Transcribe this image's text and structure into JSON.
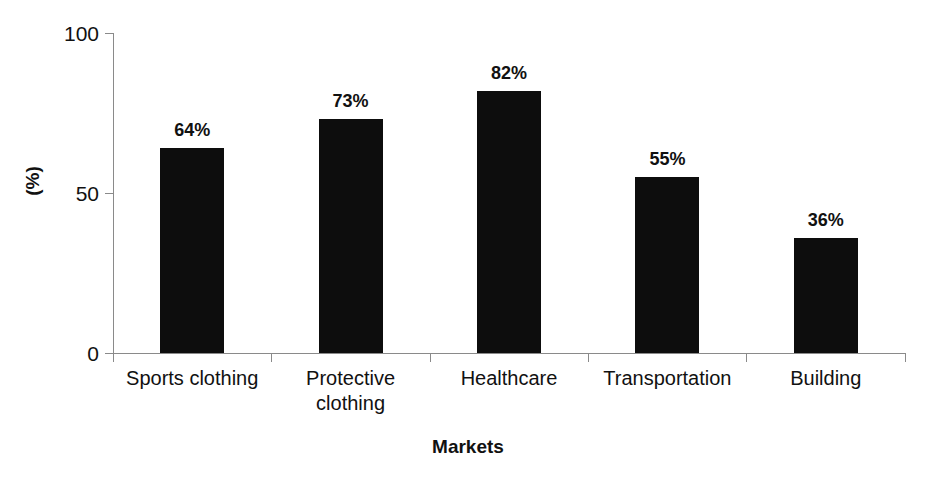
{
  "chart_data": {
    "type": "bar",
    "title": "",
    "subtitle": "",
    "xlabel": "Markets",
    "ylabel": "(%)",
    "categories": [
      "Sports clothing",
      "Protective clothing",
      "Healthcare",
      "Transportation",
      "Building"
    ],
    "category_lines": [
      [
        "Sports clothing"
      ],
      [
        "Protective",
        "clothing"
      ],
      [
        "Healthcare"
      ],
      [
        "Transportation"
      ],
      [
        "Building"
      ]
    ],
    "values": [
      64,
      73,
      82,
      55,
      36
    ],
    "value_labels": [
      "64%",
      "73%",
      "82%",
      "55%",
      "36%"
    ],
    "ylim": [
      0,
      100
    ],
    "ytick_labels": [
      "100",
      "50",
      "0"
    ],
    "ytick_values": [
      100,
      50,
      0
    ],
    "grid": false,
    "legend": false,
    "legend_position": "none",
    "bar_color": "#0d0d0d",
    "axis_color": "#8a8a8a",
    "background_color": "#ffffff"
  }
}
